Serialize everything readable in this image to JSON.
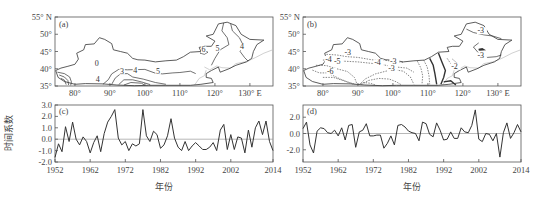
{
  "figure": {
    "panels": [
      "(a)",
      "(b)",
      "(c)",
      "(d)"
    ],
    "xlabel": "年份",
    "ylabel": "时间系数"
  },
  "maps": {
    "lat_ticks": [
      {
        "value": 55,
        "label": "55° N"
      },
      {
        "value": 50,
        "label": "50°"
      },
      {
        "value": 45,
        "label": "45°"
      },
      {
        "value": 40,
        "label": "40°"
      },
      {
        "value": 35,
        "label": "35°"
      }
    ],
    "lon_ticks": [
      {
        "value": 80,
        "label": "80°"
      },
      {
        "value": 90,
        "label": "90°"
      },
      {
        "value": 100,
        "label": "100°"
      },
      {
        "value": 110,
        "label": "110°"
      },
      {
        "value": 120,
        "label": "120°"
      },
      {
        "value": 130,
        "label": "130° E"
      }
    ],
    "a": {
      "label": "(a)",
      "contour_labels": [
        {
          "text": "0",
          "lon": 86.5,
          "lat": 40.8
        },
        {
          "text": "4",
          "lon": 86.8,
          "lat": 36.3
        },
        {
          "text": "3",
          "lon": 93.7,
          "lat": 38.6
        },
        {
          "text": "4",
          "lon": 97.5,
          "lat": 38.7
        },
        {
          "text": "5",
          "lon": 104.0,
          "lat": 38.6
        },
        {
          "text": "6",
          "lon": 117.0,
          "lat": 44.8
        },
        {
          "text": "5",
          "lon": 121.0,
          "lat": 45.2
        },
        {
          "text": "4",
          "lon": 128.0,
          "lat": 45.6
        }
      ]
    },
    "b": {
      "label": "(b)",
      "contour_labels": [
        {
          "text": "-3",
          "lon": 87.0,
          "lat": 44.0
        },
        {
          "text": "-4",
          "lon": 81.5,
          "lat": 42.0
        },
        {
          "text": "-5",
          "lon": 84.0,
          "lat": 41.3
        },
        {
          "text": "-6",
          "lon": 82.0,
          "lat": 38.5
        },
        {
          "text": "-4",
          "lon": 95.5,
          "lat": 41.0
        },
        {
          "text": "-3",
          "lon": 100.0,
          "lat": 41.3
        },
        {
          "text": "-3",
          "lon": 99.5,
          "lat": 39.5
        },
        {
          "text": "-3",
          "lon": 125.0,
          "lat": 50.3
        },
        {
          "text": "-3",
          "lon": 125.0,
          "lat": 43.0
        },
        {
          "text": "-2",
          "lon": 117.5,
          "lat": 40.0
        }
      ]
    }
  },
  "chart_data": [
    {
      "type": "line",
      "title": "(c)",
      "xlabel": "年份",
      "ylabel": "时间系数",
      "xlim": [
        1952,
        2014
      ],
      "ylim": [
        -2.0,
        3.0
      ],
      "x_ticks": [
        1952,
        1962,
        1972,
        1982,
        1992,
        2002,
        2014
      ],
      "y_ticks": [
        {
          "value": 3.0,
          "label": "3.0"
        },
        {
          "value": 2.0,
          "label": "2.0"
        },
        {
          "value": 1.0,
          "label": "1.0"
        },
        {
          "value": 0.0,
          "label": "0.0"
        },
        {
          "value": -1.0,
          "label": "-1.0"
        },
        {
          "value": -2.0,
          "label": "-2.0"
        }
      ],
      "grid": false,
      "zero_line": true,
      "x": [
        1952,
        1953,
        1954,
        1955,
        1956,
        1957,
        1958,
        1959,
        1960,
        1961,
        1962,
        1963,
        1964,
        1965,
        1966,
        1967,
        1968,
        1969,
        1970,
        1971,
        1972,
        1973,
        1974,
        1975,
        1976,
        1977,
        1978,
        1979,
        1980,
        1981,
        1982,
        1983,
        1984,
        1985,
        1986,
        1987,
        1988,
        1989,
        1990,
        1991,
        1992,
        1993,
        1994,
        1995,
        1996,
        1997,
        1998,
        1999,
        2000,
        2001,
        2002,
        2003,
        2004,
        2005,
        2006,
        2007,
        2008,
        2009,
        2010,
        2011,
        2012,
        2013,
        2014
      ],
      "values": [
        -1.6,
        -0.4,
        -1.1,
        1.1,
        -0.2,
        1.5,
        0.0,
        -0.5,
        0.2,
        -0.2,
        -1.2,
        -0.3,
        0.3,
        -1.1,
        0.5,
        1.5,
        2.0,
        2.6,
        0.1,
        -0.5,
        -0.2,
        -1.0,
        -0.4,
        -0.6,
        -0.4,
        2.6,
        0.3,
        -0.2,
        0.7,
        0.4,
        -0.8,
        -0.5,
        0.3,
        1.8,
        0.1,
        -0.7,
        -1.0,
        -0.2,
        -1.0,
        -0.6,
        -0.3,
        -0.6,
        -0.9,
        -0.9,
        -0.7,
        -0.3,
        -1.0,
        0.8,
        1.3,
        -0.9,
        0.4,
        -0.9,
        0.2,
        0.1,
        -1.2,
        0.8,
        -0.7,
        1.0,
        1.6,
        0.4,
        1.6,
        -0.2,
        -1.0
      ]
    },
    {
      "type": "line",
      "title": "(d)",
      "xlabel": "年份",
      "ylabel": "",
      "xlim": [
        1952,
        2014
      ],
      "ylim": [
        -3.5,
        3.5
      ],
      "x_ticks": [
        1952,
        1962,
        1972,
        1982,
        1992,
        2002,
        2014
      ],
      "y_ticks": [
        {
          "value": 2.0,
          "label": "2.0"
        },
        {
          "value": 0.0,
          "label": "0.0"
        },
        {
          "value": -2.0,
          "label": "-2.0"
        }
      ],
      "grid": false,
      "zero_line": true,
      "x": [
        1952,
        1953,
        1954,
        1955,
        1956,
        1957,
        1958,
        1959,
        1960,
        1961,
        1962,
        1963,
        1964,
        1965,
        1966,
        1967,
        1968,
        1969,
        1970,
        1971,
        1972,
        1973,
        1974,
        1975,
        1976,
        1977,
        1978,
        1979,
        1980,
        1981,
        1982,
        1983,
        1984,
        1985,
        1986,
        1987,
        1988,
        1989,
        1990,
        1991,
        1992,
        1993,
        1994,
        1995,
        1996,
        1997,
        1998,
        1999,
        2000,
        2001,
        2002,
        2003,
        2004,
        2005,
        2006,
        2007,
        2008,
        2009,
        2010,
        2011,
        2012,
        2013,
        2014
      ],
      "values": [
        0.6,
        1.4,
        -1.4,
        -2.4,
        0.3,
        0.7,
        0.6,
        0.1,
        0.0,
        0.4,
        -0.3,
        0.7,
        -0.8,
        1.0,
        1.1,
        -1.7,
        0.2,
        0.4,
        1.2,
        -0.3,
        -0.3,
        -0.2,
        -0.2,
        -1.8,
        -1.2,
        -0.3,
        -1.4,
        1.0,
        1.1,
        0.8,
        0.3,
        0.1,
        0.0,
        -0.9,
        1.4,
        1.2,
        -0.1,
        -0.4,
        1.3,
        0.4,
        -0.8,
        -0.7,
        0.2,
        -0.6,
        -0.6,
        0.7,
        0.2,
        0.1,
        1.0,
        2.9,
        -0.7,
        -1.0,
        0.0,
        -0.1,
        -0.9,
        0.0,
        -2.9,
        0.1,
        1.3,
        -0.6,
        0.1,
        1.1,
        0.2
      ]
    }
  ]
}
